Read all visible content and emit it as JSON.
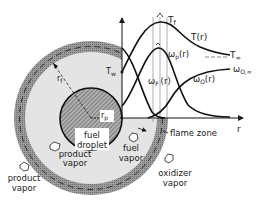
{
  "diagram": {
    "labels": {
      "T_f": "T",
      "T_f_sub": "f",
      "T_r": "T(r)",
      "T_inf": "T",
      "T_inf_sub": "∞",
      "omega_p": "ω",
      "omega_p_sub": "p",
      "omega_p_arg": "(r)",
      "omega_F": "ω",
      "omega_F_sub": "F",
      "omega_F_arg": "(r)",
      "omega_O": "ω",
      "omega_O_sub": "O",
      "omega_O_arg": "(r)",
      "omega_O_inf": "ω",
      "omega_O_inf_sub": "O,∞",
      "T_w": "T",
      "T_w_sub": "w",
      "r_f": "r",
      "r_f_sub": "f",
      "r_p": "r",
      "r_p_sub": "p",
      "r_axis": "r",
      "fuel_droplet_1": "fuel",
      "fuel_droplet_2": "droplet",
      "flame_zone": "flame zone",
      "product_vapor_inner_1": "product",
      "product_vapor_inner_2": "vapor",
      "product_vapor_outer_1": "product",
      "product_vapor_outer_2": "vapor",
      "fuel_vapor_1": "fuel",
      "fuel_vapor_2": "vapor",
      "oxidizer_vapor_1": "oxidizer",
      "oxidizer_vapor_2": "vapor"
    },
    "colors": {
      "ring": "#8a8a8a",
      "inner_fill": "#e2e2e2",
      "droplet": "#9a9a9a",
      "line": "#1a1a1a"
    }
  }
}
